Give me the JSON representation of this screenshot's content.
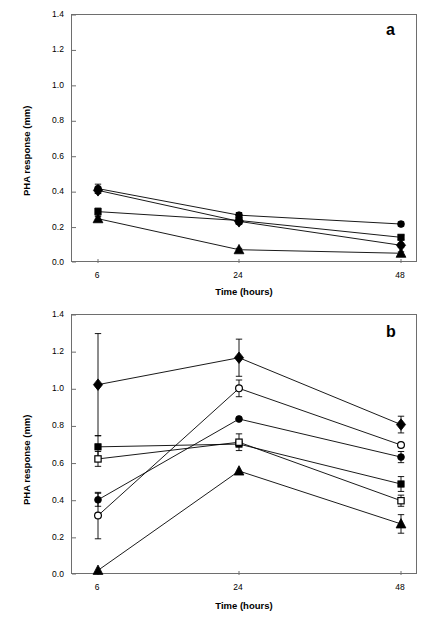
{
  "figure": {
    "background": "#ffffff",
    "line_color": "#000000",
    "frame_color": "#6e6e6e"
  },
  "panels": [
    {
      "id": "a",
      "label": "a",
      "xlabel": "Time (hours)",
      "ylabel": "PHA response (mm)",
      "xtick_labels": [
        "6",
        "24",
        "48"
      ],
      "ytick_labels": [
        "0.0",
        "0.2",
        "0.4",
        "0.6",
        "0.8",
        "1.0",
        "1.2",
        "1.4"
      ]
    },
    {
      "id": "b",
      "label": "b",
      "xlabel": "Time (hours)",
      "ylabel": "PHA response (mm)",
      "xtick_labels": [
        "6",
        "24",
        "48"
      ],
      "ytick_labels": [
        "0.0",
        "0.2",
        "0.4",
        "0.6",
        "0.8",
        "1.0",
        "1.2",
        "1.4"
      ]
    }
  ],
  "chart_data": [
    {
      "type": "line",
      "panel": "a",
      "title": "a",
      "xlabel": "Time (hours)",
      "ylabel": "PHA response (mm)",
      "categories": [
        "6",
        "24",
        "48"
      ],
      "x": [
        6,
        24,
        48
      ],
      "ylim": [
        0.0,
        1.4
      ],
      "yticks": [
        0.0,
        0.2,
        0.4,
        0.6,
        0.8,
        1.0,
        1.2,
        1.4
      ],
      "grid": false,
      "legend": "none",
      "series": [
        {
          "name": "series-1",
          "marker": "filled-circle",
          "values": [
            0.42,
            0.27,
            0.22
          ],
          "errors": [
            0.025,
            0.015,
            0.012
          ]
        },
        {
          "name": "series-2",
          "marker": "filled-square",
          "values": [
            0.29,
            0.24,
            0.145
          ],
          "errors": [
            0.02,
            0.02,
            0.012
          ]
        },
        {
          "name": "series-3",
          "marker": "filled-diamond",
          "values": [
            0.41,
            0.235,
            0.1
          ],
          "errors": [
            0.018,
            0.018,
            0.012
          ]
        },
        {
          "name": "series-4",
          "marker": "filled-triangle",
          "values": [
            0.25,
            0.075,
            0.055
          ],
          "errors": [
            0.012,
            0.008,
            0.008
          ]
        }
      ]
    },
    {
      "type": "line",
      "panel": "b",
      "title": "b",
      "xlabel": "Time (hours)",
      "ylabel": "PHA response (mm)",
      "categories": [
        "6",
        "24",
        "48"
      ],
      "x": [
        6,
        24,
        48
      ],
      "ylim": [
        0.0,
        1.4
      ],
      "yticks": [
        0.0,
        0.2,
        0.4,
        0.6,
        0.8,
        1.0,
        1.2,
        1.4
      ],
      "grid": false,
      "legend": "none",
      "series": [
        {
          "name": "series-1",
          "marker": "filled-diamond",
          "values": [
            1.025,
            1.17,
            0.81
          ],
          "errors": [
            0.275,
            0.1,
            0.045
          ]
        },
        {
          "name": "series-2",
          "marker": "open-circle",
          "values": [
            0.32,
            1.005,
            0.7
          ],
          "errors": [
            0.125,
            0.045,
            0.0
          ]
        },
        {
          "name": "series-3",
          "marker": "filled-circle",
          "values": [
            0.405,
            0.84,
            0.635
          ],
          "errors": [
            0.035,
            0.0,
            0.03
          ]
        },
        {
          "name": "series-4",
          "marker": "filled-square",
          "values": [
            0.69,
            0.705,
            0.49
          ],
          "errors": [
            0.06,
            0.0,
            0.04
          ]
        },
        {
          "name": "series-5",
          "marker": "open-square",
          "values": [
            0.625,
            0.715,
            0.4
          ],
          "errors": [
            0.04,
            0.045,
            0.03
          ]
        },
        {
          "name": "series-6",
          "marker": "filled-triangle",
          "values": [
            0.025,
            0.56,
            0.275
          ],
          "errors": [
            0.0,
            0.0,
            0.05
          ]
        }
      ]
    }
  ]
}
